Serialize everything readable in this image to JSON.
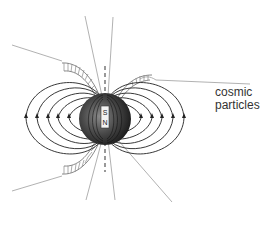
{
  "diagram": {
    "label_line1": "cosmic",
    "label_line2": "particles",
    "magnet": {
      "south": "S",
      "north": "N"
    },
    "colors": {
      "background": "#ffffff",
      "field_line": "#222222",
      "particle_line": "#a8a8a8",
      "sphere_dark": "#2a2a2a",
      "sphere_light": "#8a8a8a",
      "label": "#333333"
    }
  }
}
